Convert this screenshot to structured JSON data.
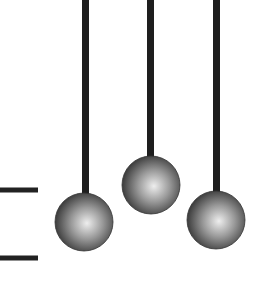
{
  "diagram": {
    "colors": {
      "background": "#ffffff",
      "rod": "#1e1e1e",
      "ball_light": "#e6e6e6",
      "ball_dark": "#2a2a2a",
      "line": "#222222"
    },
    "rods": [
      {
        "x": 85.5,
        "y1": 0,
        "y2": 198
      },
      {
        "x": 150.5,
        "y1": 0,
        "y2": 160
      },
      {
        "x": 216.5,
        "y1": 0,
        "y2": 196
      }
    ],
    "balls": [
      {
        "cx": 84,
        "cy": 222,
        "r": 29
      },
      {
        "cx": 151,
        "cy": 185,
        "r": 29
      },
      {
        "cx": 216,
        "cy": 220,
        "r": 29
      }
    ],
    "marks": [
      {
        "x1": 0,
        "x2": 38,
        "y": 190
      },
      {
        "x1": 0,
        "x2": 38,
        "y": 258
      }
    ]
  }
}
